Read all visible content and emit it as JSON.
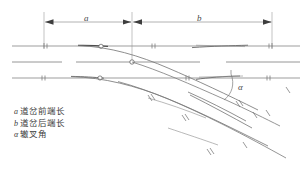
{
  "figure": {
    "width": 307,
    "height": 170,
    "background_color": "#ffffff",
    "line_color": "#6e6e6e",
    "rail_color": "#808080",
    "text_color": "#3c3c3c"
  },
  "dimensions": {
    "a": {
      "label": "a",
      "x_start": 44,
      "x_end": 131,
      "y": 22
    },
    "b": {
      "label": "b",
      "x_start": 133,
      "x_end": 272,
      "y": 22
    }
  },
  "angle": {
    "label": "α",
    "vertex_x": 219,
    "vertex_y": 97,
    "arc_label_x": 238,
    "arc_label_y": 82
  },
  "legend": {
    "items": [
      {
        "symbol": "a",
        "text": "道岔前端长"
      },
      {
        "symbol": "b",
        "text": "道岔后端长"
      },
      {
        "symbol": "α",
        "text": "辙叉角"
      }
    ]
  },
  "tracks": {
    "main_line_upper_y": 46,
    "center_line_y": 62,
    "main_line_lower_y": 78,
    "diverging_direction": "down-right"
  }
}
